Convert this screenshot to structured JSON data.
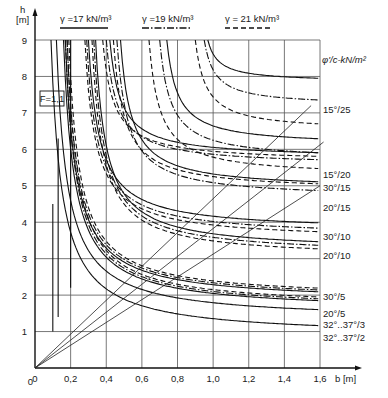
{
  "chart_data": {
    "type": "line",
    "title": "",
    "xlabel": "b [m]",
    "ylabel": "h [m]",
    "xlim": [
      0,
      1.6
    ],
    "ylim": [
      0,
      9
    ],
    "grid": true,
    "x_ticks": [
      "0",
      "0,2",
      "0,4",
      "0,6",
      "0,8",
      "1,0",
      "1,2",
      "1,4",
      "1,6"
    ],
    "y_ticks": [
      "1",
      "2",
      "3",
      "4",
      "5",
      "6",
      "7",
      "8",
      "9"
    ],
    "factor_box": "F=1,1",
    "right_header": "φ'/c-kN/m²",
    "legend": [
      {
        "label": "γ =17 kN/m³",
        "style": "solid"
      },
      {
        "label": "γ =19 kN/m³",
        "style": "dashdot"
      },
      {
        "label": "γ = 21 kN/m³",
        "style": "dashed"
      }
    ],
    "curve_groups": [
      {
        "label": "15°/25",
        "asymptote_y": [
          7.85,
          7.2,
          6.5
        ],
        "vertical_x": [
          0.97,
          0.95,
          0.9
        ]
      },
      {
        "label": "15°/20",
        "asymptote_y": [
          6.1,
          5.7,
          5.25
        ],
        "vertical_x": [
          0.74,
          0.7,
          0.64
        ]
      },
      {
        "label": "30°/15",
        "asymptote_y": [
          5.75,
          5.55,
          5.65
        ],
        "vertical_x": [
          0.42,
          0.4,
          0.38
        ]
      },
      {
        "label": "20°/15",
        "asymptote_y": [
          4.9,
          4.65,
          4.85
        ],
        "vertical_x": [
          0.48,
          0.46,
          0.44
        ]
      },
      {
        "label": "30°/10",
        "asymptote_y": [
          3.75,
          3.6,
          3.5
        ],
        "vertical_x": [
          0.3,
          0.29,
          0.28
        ]
      },
      {
        "label": "20°/10",
        "asymptote_y": [
          3.2,
          3.1,
          3.0
        ],
        "vertical_x": [
          0.34,
          0.33,
          0.32
        ]
      },
      {
        "label": "30°/5",
        "asymptote_y": [
          1.8,
          1.85,
          1.9
        ],
        "vertical_x": [
          0.17,
          0.18,
          0.19
        ]
      },
      {
        "label": "20°/5",
        "asymptote_y": [
          1.55,
          1.6,
          1.65
        ],
        "vertical_x": [
          0.16,
          0.17,
          0.18
        ]
      },
      {
        "label": "32°...37°/3",
        "asymptote_y": [
          1.3
        ],
        "vertical_x": [
          0.12
        ]
      },
      {
        "label": "32°...37°/2",
        "asymptote_y": [
          0.85
        ],
        "vertical_x": [
          0.09
        ]
      }
    ],
    "diagonals": [
      {
        "to_x": 1.55,
        "to_y": 7.2
      },
      {
        "to_x": 1.62,
        "to_y": 6.2
      },
      {
        "to_x": 1.6,
        "to_y": 5.0
      }
    ]
  },
  "labels": {
    "legend_1": "γ =17 kN/m³",
    "legend_2": "γ =19 kN/m³",
    "legend_3": "γ = 21 kN/m³",
    "y_axis_h": "h",
    "y_axis_unit": "[m]",
    "x_axis": "b [m]",
    "factor_box": "F=1,1",
    "right_header": "φ'/c-kN/m²",
    "curve_labels": [
      "15°/25",
      "15°/20",
      "30°/15",
      "20°/15",
      "30°/10",
      "20°/10",
      "30°/5",
      "20°/5",
      "32°..37°/3",
      "32°..37°/2"
    ]
  }
}
